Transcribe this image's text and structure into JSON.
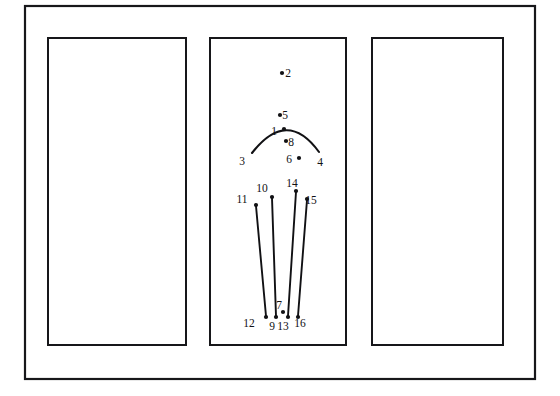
{
  "figure": {
    "background_color": "#ffffff",
    "line_color": "#111114",
    "frame_color": "#17171a",
    "canvas": {
      "width": 560,
      "height": 396
    },
    "outer_frame": {
      "x": 25,
      "y": 6,
      "width": 510,
      "height": 373,
      "stroke_width": 2.2
    },
    "panels": [
      {
        "name": "left-panel",
        "x": 48,
        "y": 38,
        "width": 138,
        "height": 307,
        "stroke_width": 2.0
      },
      {
        "name": "center-panel",
        "x": 210,
        "y": 38,
        "width": 136,
        "height": 307,
        "stroke_width": 2.0
      },
      {
        "name": "right-panel",
        "x": 372,
        "y": 38,
        "width": 131,
        "height": 307,
        "stroke_width": 2.0
      }
    ],
    "arc": {
      "name": "arc-curve",
      "start": {
        "x": 252,
        "y": 153
      },
      "control": {
        "x": 287,
        "y": 108
      },
      "end": {
        "x": 319,
        "y": 152
      }
    },
    "leader_lines": [
      {
        "name": "line-11-12",
        "x1": 256,
        "y1": 206,
        "x2": 266,
        "y2": 316
      },
      {
        "name": "line-10-9",
        "x1": 272,
        "y1": 198,
        "x2": 276,
        "y2": 316
      },
      {
        "name": "line-14-13",
        "x1": 296,
        "y1": 192,
        "x2": 288,
        "y2": 316
      },
      {
        "name": "line-15-16",
        "x1": 307,
        "y1": 200,
        "x2": 298,
        "y2": 316
      }
    ],
    "points": [
      {
        "id": "1",
        "dot": {
          "x": 284,
          "y": 129
        },
        "label": {
          "x": 274,
          "y": 135
        }
      },
      {
        "id": "2",
        "dot": {
          "x": 282,
          "y": 73
        },
        "label": {
          "x": 288,
          "y": 77
        }
      },
      {
        "id": "3",
        "dot": null,
        "label": {
          "x": 242,
          "y": 165
        }
      },
      {
        "id": "4",
        "dot": null,
        "label": {
          "x": 320,
          "y": 166
        }
      },
      {
        "id": "5",
        "dot": {
          "x": 280,
          "y": 115
        },
        "label": {
          "x": 285,
          "y": 119
        }
      },
      {
        "id": "6",
        "dot": {
          "x": 299,
          "y": 158
        },
        "label": {
          "x": 289,
          "y": 163
        }
      },
      {
        "id": "7",
        "dot": {
          "x": 283,
          "y": 312
        },
        "label": {
          "x": 279,
          "y": 309
        }
      },
      {
        "id": "8",
        "dot": {
          "x": 286,
          "y": 141
        },
        "label": {
          "x": 291,
          "y": 146
        }
      },
      {
        "id": "9",
        "dot": {
          "x": 276,
          "y": 317
        },
        "label": {
          "x": 272,
          "y": 330
        }
      },
      {
        "id": "10",
        "dot": {
          "x": 272,
          "y": 197
        },
        "label": {
          "x": 262,
          "y": 192
        }
      },
      {
        "id": "11",
        "dot": {
          "x": 256,
          "y": 205
        },
        "label": {
          "x": 242,
          "y": 203
        }
      },
      {
        "id": "12",
        "dot": {
          "x": 266,
          "y": 317
        },
        "label": {
          "x": 249,
          "y": 327
        }
      },
      {
        "id": "13",
        "dot": {
          "x": 288,
          "y": 317
        },
        "label": {
          "x": 283,
          "y": 330
        }
      },
      {
        "id": "14",
        "dot": {
          "x": 296,
          "y": 191
        },
        "label": {
          "x": 292,
          "y": 187
        }
      },
      {
        "id": "15",
        "dot": {
          "x": 307,
          "y": 199
        },
        "label": {
          "x": 311,
          "y": 204
        }
      },
      {
        "id": "16",
        "dot": {
          "x": 298,
          "y": 317
        },
        "label": {
          "x": 300,
          "y": 327
        }
      }
    ]
  }
}
